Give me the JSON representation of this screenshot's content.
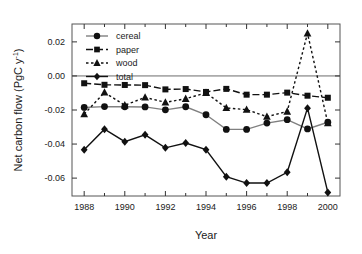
{
  "chart_data": {
    "type": "line",
    "title": "",
    "xlabel": "Year",
    "ylabel": "Net carbon flow (PgC y−1)",
    "ylabel_main": "Net carbon flow (PgC y",
    "ylabel_sup": "-1",
    "ylabel_close": ")",
    "x": [
      1988,
      1989,
      1990,
      1991,
      1992,
      1993,
      1994,
      1995,
      1996,
      1997,
      1998,
      1999,
      2000
    ],
    "xticks": [
      1988,
      1990,
      1992,
      1994,
      1996,
      1998,
      2000
    ],
    "xticklabels": [
      "1988",
      "1990",
      "1992",
      "1994",
      "1996",
      "1998",
      "2000"
    ],
    "xminorticks": [
      1989,
      1991,
      1993,
      1995,
      1997,
      1999
    ],
    "yticks": [
      0.02,
      0.0,
      -0.02,
      -0.04,
      -0.06
    ],
    "yticklabels": [
      "0.02",
      "0.00",
      "-0.02",
      "-0.04",
      "-0.06"
    ],
    "xlim": [
      1987.4,
      2000.6
    ],
    "ylim": [
      -0.0705,
      0.0305
    ],
    "grid": false,
    "zero_line": true,
    "legend_position": "top-left",
    "series": [
      {
        "name": "cereal",
        "marker": "circle",
        "linestyle": "solid",
        "color": "#808080",
        "marker_color": "#111111",
        "values": [
          -0.0185,
          -0.018,
          -0.0181,
          -0.0182,
          -0.0199,
          -0.0181,
          -0.0228,
          -0.0314,
          -0.0314,
          -0.0277,
          -0.0257,
          -0.0311,
          -0.0272
        ]
      },
      {
        "name": "paper",
        "marker": "square",
        "linestyle": "dashed",
        "color": "#111111",
        "marker_color": "#111111",
        "values": [
          -0.0043,
          -0.0052,
          -0.0053,
          -0.0054,
          -0.0079,
          -0.0077,
          -0.0094,
          -0.0076,
          -0.011,
          -0.011,
          -0.0098,
          -0.0116,
          -0.0128
        ]
      },
      {
        "name": "wood",
        "marker": "triangle",
        "linestyle": "dotted",
        "color": "#111111",
        "marker_color": "#111111",
        "values": [
          -0.0224,
          -0.0097,
          -0.0172,
          -0.0126,
          -0.0155,
          -0.0134,
          -0.0099,
          -0.0188,
          -0.0198,
          -0.0239,
          -0.0209,
          0.025,
          -0.0277
        ]
      },
      {
        "name": "total",
        "marker": "diamond",
        "linestyle": "solid",
        "color": "#111111",
        "marker_color": "#111111",
        "values": [
          -0.0434,
          -0.0313,
          -0.0386,
          -0.0346,
          -0.0422,
          -0.0394,
          -0.0433,
          -0.0592,
          -0.0629,
          -0.0629,
          -0.0566,
          -0.0189,
          -0.0684
        ]
      }
    ]
  },
  "legend": {
    "items": [
      {
        "label": "cereal"
      },
      {
        "label": "paper"
      },
      {
        "label": "wood"
      },
      {
        "label": "total"
      }
    ]
  }
}
